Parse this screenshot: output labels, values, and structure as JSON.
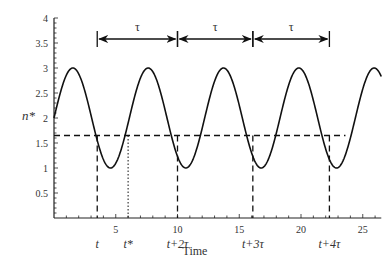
{
  "chart_data": {
    "type": "line",
    "title": "",
    "xlabel": "Time",
    "ylabel": "n*",
    "xlim": [
      0,
      26
    ],
    "ylim": [
      0,
      4
    ],
    "x_ticks": [
      5,
      10,
      15,
      20,
      25
    ],
    "y_ticks": [
      0.5,
      1,
      1.5,
      2,
      2.5,
      3,
      3.5,
      4
    ],
    "grid": false,
    "series": [
      {
        "name": "n*(t)",
        "style": "solid",
        "function": "2 + sin(2*pi*(t)/6.1)",
        "amplitude": 1,
        "mean": 2,
        "period": 6.1,
        "x": [
          0,
          1.5,
          3,
          4.6,
          6.1,
          7.6,
          9.2,
          10.7,
          12.2,
          13.8,
          15.3,
          16.8,
          18.3,
          19.9,
          21.4,
          22.9,
          24.4,
          26
        ],
        "values": [
          2,
          3,
          2,
          1,
          2,
          3,
          2,
          1,
          2,
          3,
          2,
          1,
          2,
          3,
          2,
          1,
          2,
          2.1
        ]
      },
      {
        "name": "threshold",
        "style": "dashed",
        "y": 1.65
      }
    ],
    "annotations": {
      "vertical_dashed": [
        {
          "x": 3.5,
          "label": "t"
        },
        {
          "x": 10,
          "label": "t+2τ"
        },
        {
          "x": 16.1,
          "label": "t+3τ"
        },
        {
          "x": 22.3,
          "label": "t+4τ"
        }
      ],
      "vertical_dotted": [
        {
          "x": 6.0,
          "label": "t*"
        }
      ],
      "intervals": [
        {
          "from": 3.5,
          "to": 10,
          "label": "τ"
        },
        {
          "from": 10,
          "to": 16.1,
          "label": "τ"
        },
        {
          "from": 16.1,
          "to": 22.3,
          "label": "τ"
        }
      ]
    }
  },
  "labels": {
    "xlabel": "Time",
    "ylabel": "n*",
    "tau": "τ",
    "t": "t",
    "tstar": "t*",
    "t2": "t+2τ",
    "t3": "t+3τ",
    "t4": "t+4τ"
  }
}
